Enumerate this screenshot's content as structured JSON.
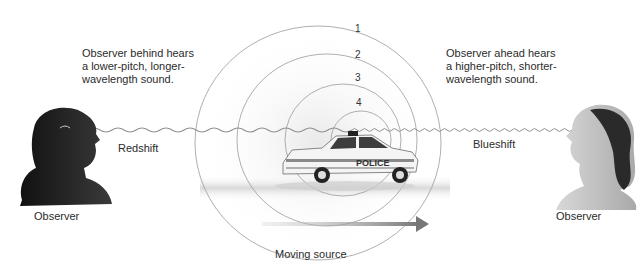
{
  "diagram": {
    "left_caption": {
      "lines": [
        "Observer behind hears",
        "a lower-pitch, longer-",
        "wavelength sound."
      ]
    },
    "right_caption": {
      "lines": [
        "Observer ahead hears",
        "a higher-pitch, shorter-",
        "wavelength sound."
      ]
    },
    "left_shift_label": "Redshift",
    "right_shift_label": "Blueshift",
    "left_observer_label": "Observer",
    "right_observer_label": "Observer",
    "source_label": "Moving source",
    "car_text": "POLICE",
    "wavefronts": [
      {
        "label": "1",
        "cx": 318,
        "cy": 143,
        "rx": 123,
        "ry": 117
      },
      {
        "label": "2",
        "cx": 327,
        "cy": 140,
        "rx": 90,
        "ry": 86
      },
      {
        "label": "3",
        "cx": 343,
        "cy": 140,
        "rx": 58,
        "ry": 56
      },
      {
        "label": "4",
        "cx": 361,
        "cy": 140,
        "rx": 30,
        "ry": 29
      }
    ],
    "colors": {
      "ring": "#9a9a9a",
      "wave": "#8f8f8f",
      "arrow": "#7c7c7c",
      "shadow": "#d8d8d8",
      "text": "#2b2b2b"
    }
  }
}
